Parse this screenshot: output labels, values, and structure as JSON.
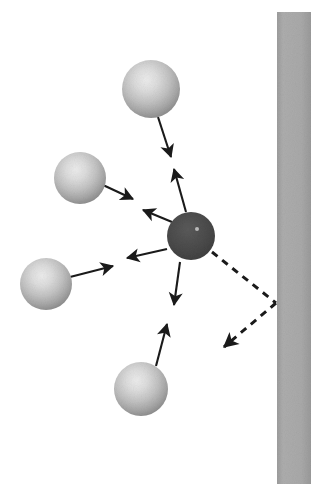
{
  "figure": {
    "background_color": "#ffffff",
    "width": 327,
    "height": 484
  },
  "colors": {
    "wall": "#a8a8a8",
    "wall_edge": "#9c9c9c",
    "central_particle_fill": "#4a4a4a",
    "central_particle_edge": "#3c3c3c",
    "central_particle_highlight": "#b4b4b4",
    "neighbor_light": "#dcdcdc",
    "neighbor_mid": "#b8b8b8",
    "neighbor_dark": "#8e8e8e",
    "arrow": "#1a1a1a",
    "dashed_arrow": "#1a1a1a",
    "background": "#ffffff"
  },
  "wall": {
    "name": "wall-barrier",
    "x": 277,
    "y": 12,
    "width": 34,
    "height": 472,
    "fill": "#a8a8a8"
  },
  "central_particle": {
    "name": "central-particle",
    "cx": 191,
    "cy": 236,
    "r": 24,
    "fill": "#4a4a4a",
    "highlight_cx": 197,
    "highlight_cy": 229,
    "highlight_r": 2
  },
  "neighbors": [
    {
      "id": "neighbor-top",
      "label": "top neighbor sphere",
      "cx": 151,
      "cy": 89,
      "r": 29
    },
    {
      "id": "neighbor-upper-left",
      "label": "upper left neighbor sphere",
      "cx": 80,
      "cy": 178,
      "r": 26
    },
    {
      "id": "neighbor-lower-left",
      "label": "lower left neighbor sphere",
      "cx": 46,
      "cy": 284,
      "r": 26
    },
    {
      "id": "neighbor-bottom",
      "label": "bottom neighbor sphere",
      "cx": 141,
      "cy": 389,
      "r": 27
    }
  ],
  "force_arrows": [
    {
      "id": "arrow-top-neighbor-inward",
      "label": "force from top sphere toward center",
      "x1": 158,
      "y1": 117,
      "x2": 171,
      "y2": 157,
      "head": "end"
    },
    {
      "id": "arrow-center-toward-top",
      "label": "force from center toward top sphere",
      "x1": 186,
      "y1": 212,
      "x2": 174,
      "y2": 169,
      "head": "end"
    },
    {
      "id": "arrow-upper-left-inward",
      "label": "force from upper left sphere toward center",
      "x1": 103,
      "y1": 185,
      "x2": 133,
      "y2": 199,
      "head": "end"
    },
    {
      "id": "arrow-center-toward-upper-left",
      "label": "force from center toward upper left sphere",
      "x1": 172,
      "y1": 222,
      "x2": 143,
      "y2": 210,
      "head": "end"
    },
    {
      "id": "arrow-lower-left-inward",
      "label": "force from lower left sphere toward center",
      "x1": 70,
      "y1": 277,
      "x2": 113,
      "y2": 266,
      "head": "end"
    },
    {
      "id": "arrow-center-toward-lower-left",
      "label": "force from center toward lower left sphere",
      "x1": 167,
      "y1": 249,
      "x2": 127,
      "y2": 258,
      "head": "end"
    },
    {
      "id": "arrow-center-toward-bottom",
      "label": "force from center toward bottom sphere",
      "x1": 180,
      "y1": 262,
      "x2": 174,
      "y2": 305,
      "head": "end"
    },
    {
      "id": "arrow-bottom-neighbor-inward",
      "label": "force from bottom sphere toward center",
      "x1": 156,
      "y1": 366,
      "x2": 167,
      "y2": 324,
      "head": "end"
    }
  ],
  "dashed_path": {
    "id": "wall-reflection-path",
    "label": "dashed reflection path off wall",
    "segments": [
      {
        "x1": 212,
        "y1": 252,
        "x2": 276,
        "y2": 303
      },
      {
        "x1": 276,
        "y1": 303,
        "x2": 220,
        "y2": 350
      }
    ],
    "arrow_tip_x": 216,
    "arrow_tip_y": 354,
    "dash_pattern": "7,6",
    "stroke_width": 3
  },
  "accessibility": {
    "description": "Diagram of a dark central particle surrounded by four light spheres. Pairs of opposing solid arrows connect the central particle to each neighbor, indicating mutual forces. A dashed path leads from the central particle to a vertical gray wall on the right and reflects back down and to the left, ending in an arrowhead."
  }
}
